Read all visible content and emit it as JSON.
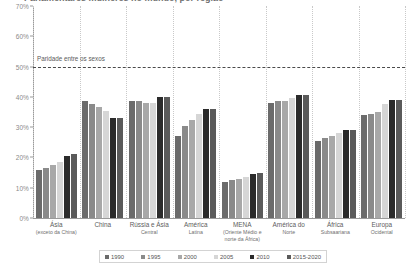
{
  "chart_data": {
    "type": "bar",
    "title": "Parlamentares mulheres no mundo, por região",
    "xlabel": "",
    "ylabel": "",
    "ylim": [
      0,
      70
    ],
    "ytick_labels": [
      "0%",
      "10%",
      "20%",
      "30%",
      "40%",
      "50%",
      "60%",
      "70%"
    ],
    "ytick_values": [
      0,
      10,
      20,
      30,
      40,
      50,
      60,
      70
    ],
    "grid": "vertical-dotted-group-separators",
    "legend_position": "bottom",
    "annotation": {
      "label": "Paridade entre os sexos",
      "value": 50
    },
    "categories": [
      "Ásia",
      "China",
      "Rússia e Ásia Central",
      "América Latina",
      "MENA",
      "América do Norte",
      "África Subsaariana",
      "Europa Ocidental"
    ],
    "category_labels": [
      {
        "main": "Ásia",
        "sub": "(exceto da China)"
      },
      {
        "main": "China",
        "sub": ""
      },
      {
        "main": "Rússia e Ásia",
        "sub": "Central"
      },
      {
        "main": "América",
        "sub": "Latina"
      },
      {
        "main": "MENA",
        "sub": "(Oriente Médio e norte da África)"
      },
      {
        "main": "América do",
        "sub": "Norte"
      },
      {
        "main": "África",
        "sub": "Subsaariana"
      },
      {
        "main": "Europa",
        "sub": "Ocidental"
      }
    ],
    "series": [
      {
        "name": "1990",
        "color": "#6b6b6b",
        "values": [
          16.0,
          38.5,
          38.5,
          27.0,
          12.0,
          38.0,
          25.5,
          34.0
        ]
      },
      {
        "name": "1995",
        "color": "#8a8a8a",
        "values": [
          16.5,
          37.5,
          38.5,
          30.5,
          12.5,
          38.5,
          26.5,
          34.5
        ]
      },
      {
        "name": "2000",
        "color": "#a8a8a8",
        "values": [
          17.5,
          36.5,
          38.0,
          32.5,
          13.0,
          38.5,
          27.0,
          35.0
        ]
      },
      {
        "name": "2005",
        "color": "#d6d6d6",
        "values": [
          18.5,
          35.5,
          38.0,
          34.5,
          13.5,
          39.5,
          28.0,
          37.5
        ]
      },
      {
        "name": "2010",
        "color": "#2b2b2b",
        "values": [
          20.5,
          33.0,
          40.0,
          36.0,
          14.5,
          40.5,
          29.0,
          39.0
        ]
      },
      {
        "name": "2015-2020",
        "color": "#5a5a5a",
        "values": [
          21.0,
          33.0,
          40.0,
          36.0,
          15.0,
          40.5,
          29.0,
          39.0
        ]
      }
    ]
  }
}
